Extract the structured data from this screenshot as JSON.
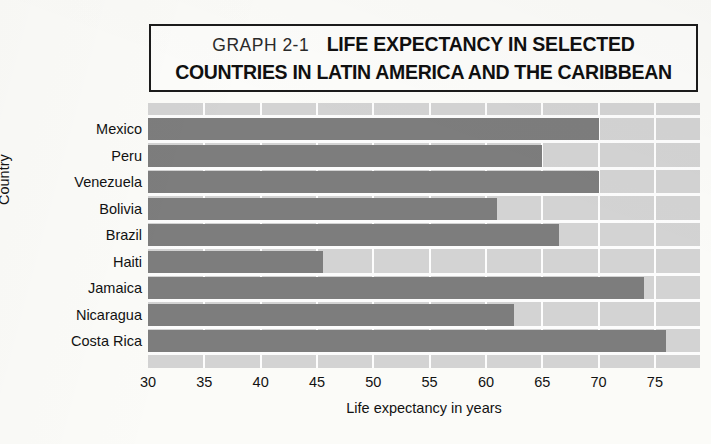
{
  "title": {
    "graph_number": "GRAPH 2-1",
    "line1": "LIFE EXPECTANCY IN SELECTED",
    "line2": "COUNTRIES IN LATIN AMERICA AND THE CARIBBEAN"
  },
  "colors": {
    "bar": "#7d7d7d",
    "plot_background": "#d3d3d3",
    "gridline": "#fdfdfd",
    "page_background": "#fbfbf8",
    "text": "#121212"
  },
  "chart_data": {
    "type": "bar",
    "orientation": "horizontal",
    "title": "GRAPH 2-1  LIFE EXPECTANCY IN SELECTED COUNTRIES IN LATIN AMERICA AND THE CARIBBEAN",
    "xlabel": "Life expectancy in years",
    "ylabel": "Country",
    "xlim": [
      30,
      79
    ],
    "xticks": [
      30,
      35,
      40,
      45,
      50,
      55,
      60,
      65,
      70,
      75
    ],
    "grid": true,
    "legend": "none",
    "categories": [
      "Mexico",
      "Peru",
      "Venezuela",
      "Bolivia",
      "Brazil",
      "Haiti",
      "Jamaica",
      "Nicaragua",
      "Costa Rica"
    ],
    "values": [
      70,
      65,
      70,
      61,
      66.5,
      45.5,
      74,
      62.5,
      76
    ]
  }
}
